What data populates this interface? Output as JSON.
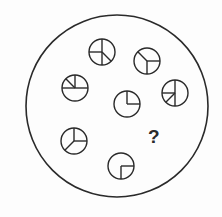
{
  "puzzle": {
    "type": "figure-reasoning",
    "question_mark": "?",
    "colors": {
      "stroke": "#2a2a2a",
      "background": "#fdfdfd"
    },
    "outer_circle": {
      "cx": 117,
      "cy": 106,
      "r": 91
    },
    "small_circles": [
      {
        "id": "A",
        "cx": 102,
        "cy": 52,
        "r": 13,
        "segments": [
          "N",
          "S",
          "W",
          "SE"
        ]
      },
      {
        "id": "B",
        "cx": 147,
        "cy": 61,
        "r": 13,
        "segments": [
          "NW",
          "E",
          "S"
        ]
      },
      {
        "id": "C",
        "cx": 75,
        "cy": 88,
        "r": 13,
        "segments": [
          "W",
          "E",
          "N",
          "NW"
        ]
      },
      {
        "id": "D",
        "cx": 175,
        "cy": 93,
        "r": 13,
        "segments": [
          "N",
          "S",
          "W",
          "SW"
        ]
      },
      {
        "id": "E",
        "cx": 127,
        "cy": 104,
        "r": 13,
        "segments": [
          "N",
          "E"
        ]
      },
      {
        "id": "F",
        "cx": 74,
        "cy": 141,
        "r": 13,
        "segments": [
          "N",
          "E",
          "SW"
        ]
      },
      {
        "id": "G",
        "cx": 121,
        "cy": 166,
        "r": 13,
        "segments": [
          "E",
          "S"
        ]
      }
    ],
    "question": {
      "x": 148,
      "y": 127
    }
  }
}
